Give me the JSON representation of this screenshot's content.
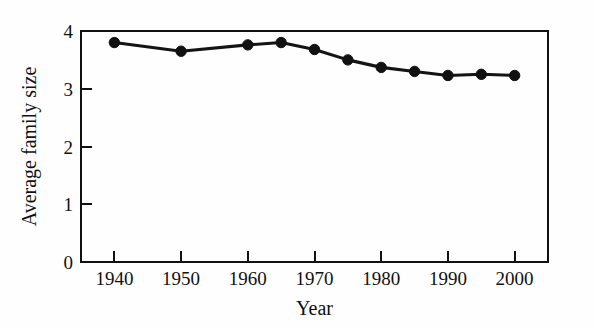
{
  "chart_data": {
    "type": "line",
    "title": "",
    "xlabel": "Year",
    "ylabel": "Average family size",
    "x": [
      1940,
      1950,
      1960,
      1965,
      1970,
      1975,
      1980,
      1985,
      1990,
      1995,
      2000
    ],
    "values": [
      3.8,
      3.65,
      3.76,
      3.8,
      3.68,
      3.5,
      3.37,
      3.3,
      3.23,
      3.25,
      3.23
    ],
    "series": [
      {
        "name": "Average family size",
        "values": [
          3.8,
          3.65,
          3.76,
          3.8,
          3.68,
          3.5,
          3.37,
          3.3,
          3.23,
          3.25,
          3.23
        ]
      }
    ],
    "xlim": [
      1935,
      2005
    ],
    "ylim": [
      0,
      4
    ],
    "xticks": [
      1940,
      1950,
      1960,
      1970,
      1980,
      1990,
      2000
    ],
    "xtick_labels": [
      "1940",
      "1950",
      "1960",
      "1970",
      "1980",
      "1990",
      "2000"
    ],
    "yticks": [
      0,
      1,
      2,
      3,
      4
    ],
    "ytick_labels": [
      "0",
      "1",
      "2",
      "3",
      "4"
    ],
    "grid": false,
    "legend": false,
    "legend_position": "none",
    "marker": "filled-circle",
    "line_color": "#111111",
    "marker_color": "#111111",
    "background_color": "#fefefe",
    "axis_color": "#111111"
  }
}
